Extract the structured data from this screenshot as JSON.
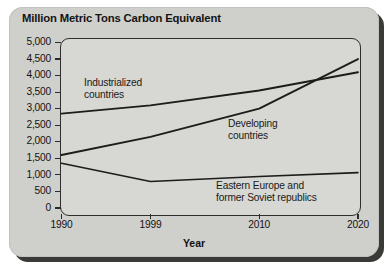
{
  "chart_data": {
    "type": "line",
    "title": "Million Metric Tons Carbon Equivalent",
    "xlabel": "Year",
    "ylabel": "Million Metric Tons Carbon Equivalent",
    "xlim": [
      1990,
      2020
    ],
    "ylim": [
      0,
      5000
    ],
    "grid": false,
    "legend": "inline-annotations",
    "xticklabels": [
      "1990",
      "1999",
      "2010",
      "2020"
    ],
    "xtickvalues": [
      1990,
      1999,
      2010,
      2020
    ],
    "yticklabels": [
      "0",
      "500",
      "1,000",
      "1,500",
      "2,000",
      "2,500",
      "3,000",
      "3,500",
      "4,000",
      "4,500",
      "5,000"
    ],
    "ytickvalues": [
      0,
      500,
      1000,
      1500,
      2000,
      2500,
      3000,
      3500,
      4000,
      4500,
      5000
    ],
    "x": [
      1990,
      1999,
      2010,
      2020
    ],
    "series": [
      {
        "name": "Industrialized countries",
        "label_line1": "Industrialized",
        "label_line2": "countries",
        "values": [
          2850,
          3100,
          3550,
          4100
        ]
      },
      {
        "name": "Developing countries",
        "label_line1": "Developing",
        "label_line2": "countries",
        "values": [
          1600,
          2150,
          3000,
          4500
        ]
      },
      {
        "name": "Eastern Europe and former Soviet republics",
        "label_line1": "Eastern Europe and",
        "label_line2": "former Soviet republics",
        "values": [
          1350,
          800,
          950,
          1070
        ]
      }
    ],
    "colors": {
      "line": "#1c1c1a",
      "panel_background": "#d7d7d3",
      "card_background": "#cfcfcb",
      "text": "#131313"
    }
  }
}
